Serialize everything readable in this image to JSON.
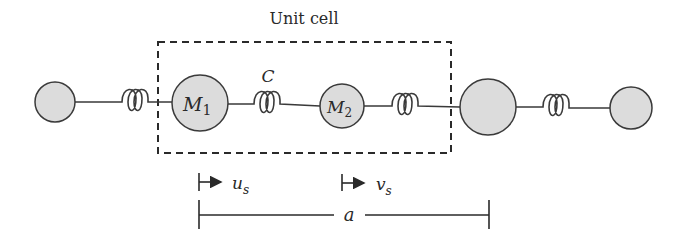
{
  "diagram": {
    "title": "Unit cell",
    "spring_constant_label": "C",
    "masses": [
      {
        "id": "left-neighbor",
        "label": ""
      },
      {
        "id": "M1",
        "label": "M",
        "subscript": "1"
      },
      {
        "id": "M2",
        "label": "M",
        "subscript": "2"
      },
      {
        "id": "right-neighbor-large",
        "label": ""
      },
      {
        "id": "right-neighbor-small",
        "label": ""
      }
    ],
    "displacements": [
      {
        "symbol": "u",
        "subscript": "s"
      },
      {
        "symbol": "v",
        "subscript": "s"
      }
    ],
    "lattice_constant_label": "a",
    "colors": {
      "mass_fill": "#dcdcdc",
      "stroke": "#3a3a3a"
    }
  }
}
